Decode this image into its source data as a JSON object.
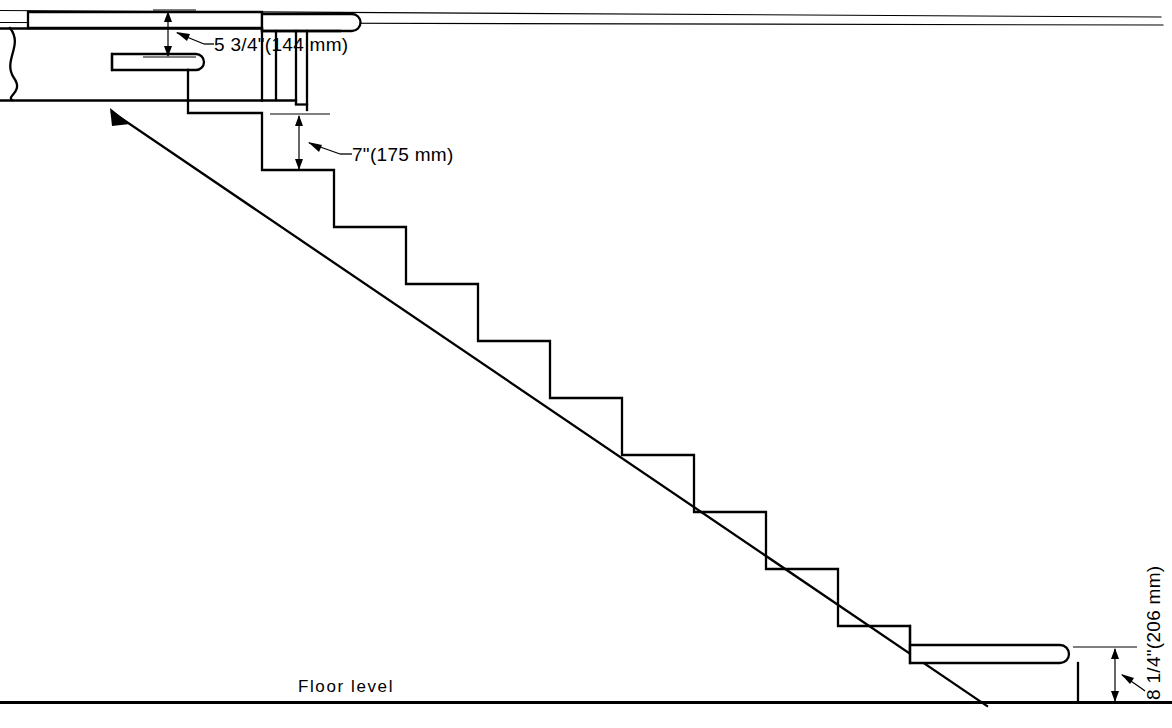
{
  "drawing": {
    "title": "Stair Section - Riser and Tread Dimensions",
    "type": "architectural-section",
    "units_note": "imperial with metric in parentheses",
    "background_color": "#ffffff",
    "line_color": "#000000"
  },
  "labels": {
    "floor_level": "Floor level",
    "top_riser": "5 3/4\"(144 mm)",
    "typical_riser": "7\"(175 mm)",
    "bottom_riser": "8 1/4\"(206 mm)"
  },
  "dimensions": [
    {
      "id": "top-riser",
      "text": "5 3/4\"(144 mm)",
      "value_inches": 5.75,
      "value_mm": 144,
      "describes": "first riser height at top landing"
    },
    {
      "id": "typical-riser",
      "text": "7\"(175 mm)",
      "value_inches": 7,
      "value_mm": 175,
      "describes": "typical riser height"
    },
    {
      "id": "bottom-riser",
      "text": "8 1/4\"(206 mm)",
      "value_inches": 8.25,
      "value_mm": 206,
      "describes": "bottom riser height at floor"
    }
  ],
  "annotations": {
    "floor_label": "Floor level"
  },
  "geometry": {
    "step_count": 11,
    "tread_run_px": 72,
    "riser_rise_px": 57,
    "floor_line_y": 702,
    "ceiling_line_y": 11,
    "soffit_line_y": 23
  }
}
